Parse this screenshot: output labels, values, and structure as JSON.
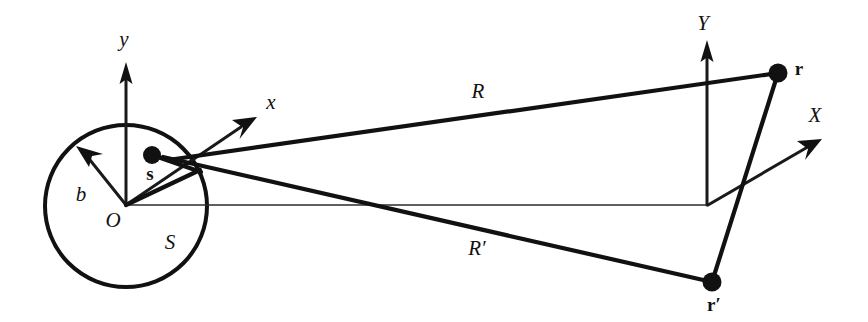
{
  "figure": {
    "background_color": "#ffffff",
    "ink_color": "#111111",
    "width": 868,
    "height": 322
  },
  "labels": {
    "axis_y_local": "y",
    "axis_x_local": "x",
    "axis_Y_global": "Y",
    "axis_X_global": "X",
    "origin": "O",
    "region": "S",
    "radius": "b",
    "source_point": "s",
    "field_point": "r",
    "field_point_prime": "r′",
    "distance_R": "R",
    "distance_R_prime": "R′"
  },
  "geometry": {
    "circle": {
      "cx": 126,
      "cy": 206,
      "r": 81
    },
    "origin": {
      "x": 126,
      "y": 205
    },
    "source_point": {
      "x": 152,
      "y": 155
    },
    "field_point_r": {
      "x": 778,
      "y": 73
    },
    "field_point_r_prime": {
      "x": 712,
      "y": 282
    },
    "global_origin": {
      "x": 708,
      "y": 205
    },
    "axis_y_tip": {
      "x": 126,
      "y": 65
    },
    "axis_x_tip": {
      "x": 255,
      "y": 118
    },
    "axis_Y_tip": {
      "x": 707,
      "y": 42
    },
    "axis_X_tip": {
      "x": 820,
      "y": 140
    },
    "radius_arrow_tip": {
      "x": 79,
      "y": 151
    }
  },
  "label_positions": {
    "y": {
      "x": 124,
      "y": 41
    },
    "x": {
      "x": 271,
      "y": 104
    },
    "Y": {
      "x": 703,
      "y": 25
    },
    "X": {
      "x": 815,
      "y": 117
    },
    "O": {
      "x": 113,
      "y": 222
    },
    "S": {
      "x": 170,
      "y": 244
    },
    "b": {
      "x": 81,
      "y": 196
    },
    "s": {
      "x": 150,
      "y": 175
    },
    "r": {
      "x": 799,
      "y": 71
    },
    "r_prime": {
      "x": 714,
      "y": 307
    },
    "R": {
      "x": 478,
      "y": 93
    },
    "R_prime": {
      "x": 477,
      "y": 250
    }
  }
}
